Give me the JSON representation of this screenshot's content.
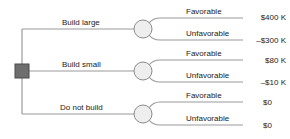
{
  "diagram": {
    "type": "decision-tree",
    "colors": {
      "line": "#9a9a9a",
      "decision_node_fill": "#6e6e6e",
      "decision_node_stroke": "#4a4a4a",
      "chance_node_fill": "#eeeeee",
      "chance_node_stroke": "#8a8a8a",
      "text": "#222222"
    },
    "decision_node": {
      "shape": "square"
    },
    "alternatives": [
      {
        "label": "Build large",
        "outcomes": [
          {
            "label": "Favorable",
            "payoff": "$400 K"
          },
          {
            "label": "Unfavorable",
            "payoff": "–$300 K"
          }
        ]
      },
      {
        "label": "Build small",
        "outcomes": [
          {
            "label": "Favorable",
            "payoff": "$80 K"
          },
          {
            "label": "Unfavorable",
            "payoff": "–$10 K"
          }
        ]
      },
      {
        "label": "Do not build",
        "outcomes": [
          {
            "label": "Favorable",
            "payoff": "$0"
          },
          {
            "label": "Unfavorable",
            "payoff": "$0"
          }
        ]
      }
    ]
  }
}
